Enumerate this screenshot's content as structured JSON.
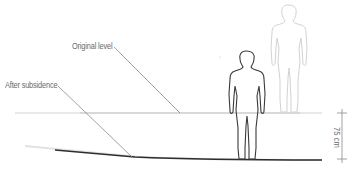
{
  "diagram": {
    "labels": {
      "original_level": "Original level",
      "after_subsidence": "After subsidence"
    },
    "dimension": {
      "value": "75 cm",
      "meaning": "vertical drop between original level and subsided level"
    },
    "figures": [
      {
        "name": "figure-original",
        "style": "faded",
        "position": "standing on original level"
      },
      {
        "name": "figure-subsided",
        "style": "solid",
        "position": "standing on subsided ground"
      }
    ],
    "colors": {
      "original_line": "#c8c8c8",
      "subsided_line": "#333333",
      "faded_figure": "#d0d0d0",
      "solid_figure": "#3a3a3a",
      "label_text": "#6a6a6a",
      "leader_line": "#7a7a7a",
      "dimension_line": "#8a8a8a"
    }
  }
}
